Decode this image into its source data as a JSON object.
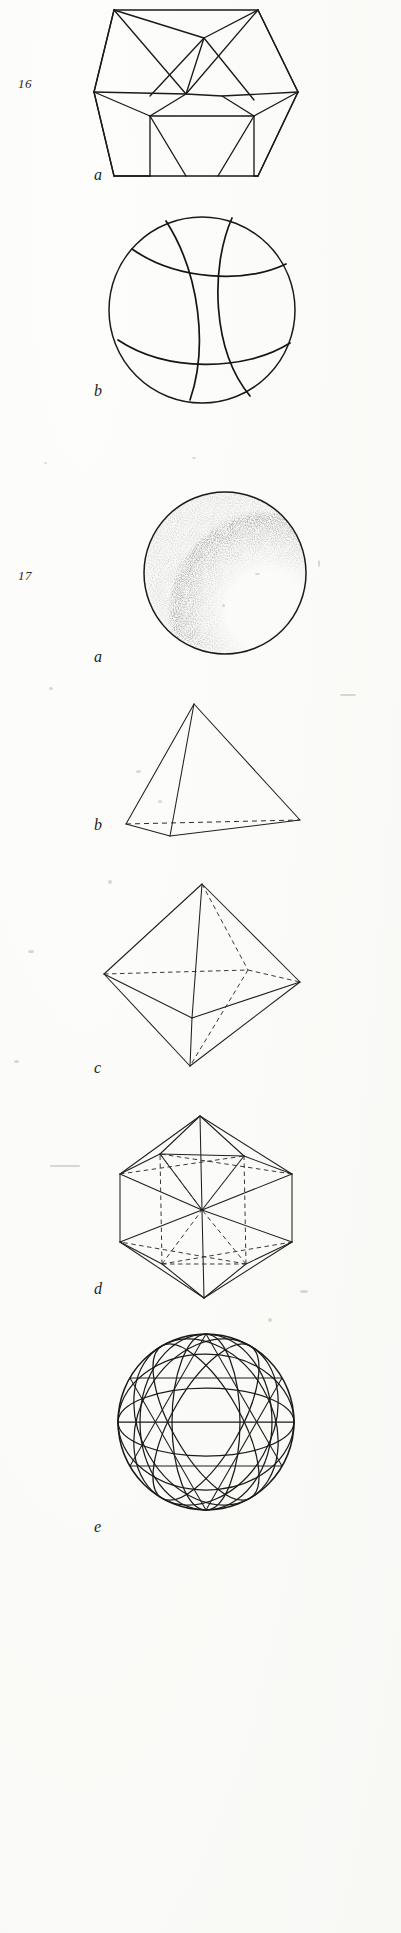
{
  "plate": {
    "background_color": "#fbfbf9",
    "ink_color": "#1a1a18",
    "figures": [
      {
        "number": "16",
        "number_label": "16",
        "parts": [
          {
            "key": "a",
            "label": "a",
            "caption": "a",
            "shape": "icosahedron-star-projection"
          },
          {
            "key": "b",
            "label": "b",
            "caption": "b",
            "shape": "sphere-with-great-circle-arcs"
          }
        ]
      },
      {
        "number": "17",
        "number_label": "17",
        "parts": [
          {
            "key": "a",
            "label": "a",
            "caption": "a",
            "shape": "stippled-shaded-sphere"
          },
          {
            "key": "b",
            "label": "b",
            "caption": "b",
            "shape": "tetrahedron"
          },
          {
            "key": "c",
            "label": "c",
            "caption": "c",
            "shape": "octahedron"
          },
          {
            "key": "d",
            "label": "d",
            "caption": "d",
            "shape": "icosahedron"
          },
          {
            "key": "e",
            "label": "e",
            "caption": "e",
            "shape": "geodesic-sphere"
          }
        ]
      }
    ]
  },
  "labels": {
    "fig16_number": "16",
    "fig16_a": "a",
    "fig16_b": "b",
    "fig17_number": "17",
    "fig17_a": "a",
    "fig17_b": "b",
    "fig17_c": "c",
    "fig17_d": "d",
    "fig17_e": "e"
  }
}
